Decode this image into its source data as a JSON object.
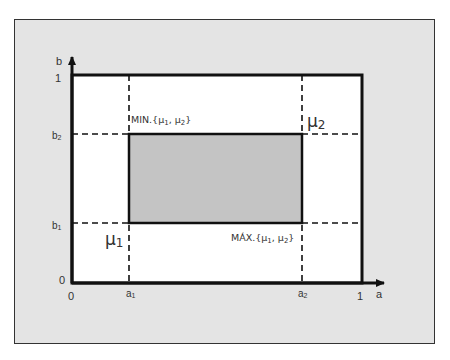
{
  "diagram": {
    "axes": {
      "x_label": "a",
      "y_label": "b",
      "x_ticks": [
        "0",
        "a1",
        "a2",
        "1"
      ],
      "y_ticks": [
        "0",
        "b1",
        "b2",
        "1"
      ]
    },
    "points": {
      "mu1": "μ1",
      "mu2": "μ2"
    },
    "annotations": {
      "min_label": "MIN.{μ1, μ2}",
      "max_label": "MÁX.{μ1, μ2}"
    },
    "colors": {
      "frame_bg": "#e4e4e4",
      "plot_bg": "#ffffff",
      "shaded_rect": "#c4c4c4",
      "lines": "#111111"
    }
  }
}
